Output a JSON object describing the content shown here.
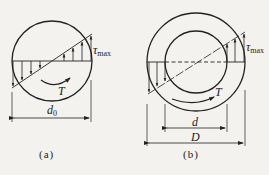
{
  "figure_a": {
    "caption": "(a)",
    "shear_label_symbol": "τ",
    "shear_label_sub": "max",
    "torque_label": "T",
    "diameter_label_symbol": "d",
    "diameter_label_sub": "0"
  },
  "figure_b": {
    "caption": "(b)",
    "shear_label_symbol": "τ",
    "shear_label_sub": "max",
    "torque_label": "T",
    "inner_diameter_label": "d",
    "outer_diameter_label": "D"
  },
  "colors": {
    "line": "#222222",
    "background": "#f3f2ef"
  }
}
